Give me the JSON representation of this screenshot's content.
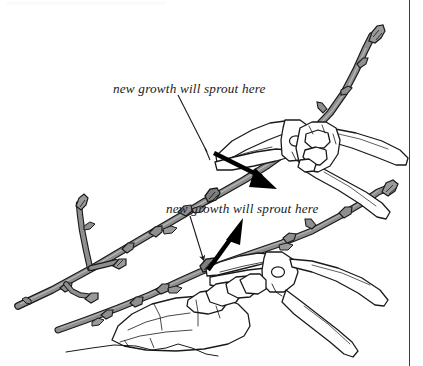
{
  "figure": {
    "type": "line-drawing-illustration",
    "background_color": "#ffffff",
    "ink_color": "#1a1a1a",
    "stem_fill_color": "#8a8a8a",
    "stem_fill_color_light": "#a3a3a3",
    "arrow_color": "#000000",
    "border_color": "#3a3a3a",
    "annotations": [
      {
        "id": "upper",
        "text": "new growth will sprout here",
        "leader_from": {
          "x": 178,
          "y": 95
        },
        "leader_to": {
          "x": 207,
          "y": 152
        },
        "arrow_from": {
          "x": 211,
          "y": 152
        },
        "arrow_to": {
          "x": 272,
          "y": 184
        }
      },
      {
        "id": "lower",
        "text": "new growth will sprout here",
        "leader_from": {
          "x": 190,
          "y": 216
        },
        "leader_to": {
          "x": 204,
          "y": 262
        },
        "arrow_from": {
          "x": 206,
          "y": 272
        },
        "arrow_to": {
          "x": 245,
          "y": 222
        }
      }
    ],
    "elements": [
      {
        "name": "upper-branch",
        "description": "long gray stem rising to upper right with buds"
      },
      {
        "name": "upper-pruners",
        "description": "hand pruners cutting the upper branch, gripped by a hand"
      },
      {
        "name": "lower-branch",
        "description": "second gray stem with side shoots and buds"
      },
      {
        "name": "lower-pruners",
        "description": "hand pruners cutting the lower branch, gripped by a hand"
      },
      {
        "name": "ground-line",
        "description": "thin wavy line beneath the lower hand"
      }
    ]
  },
  "labels": {
    "upper_caption": "new growth will sprout here",
    "lower_caption": "new growth will sprout here"
  }
}
